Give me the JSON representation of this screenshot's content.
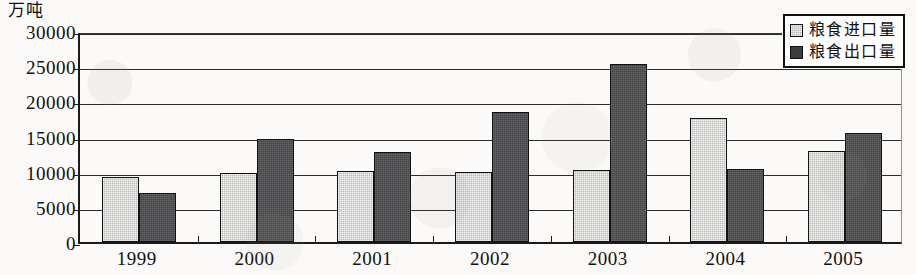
{
  "chart_data": {
    "type": "bar",
    "title": "",
    "unit_label": "万吨",
    "xlabel": "",
    "ylabel": "",
    "categories": [
      "1999",
      "2000",
      "2001",
      "2002",
      "2003",
      "2004",
      "2005"
    ],
    "series": [
      {
        "name": "粮食进口量",
        "color": "#b9b9b7",
        "values": [
          9200,
          9800,
          10100,
          10000,
          10200,
          17600,
          12900
        ]
      },
      {
        "name": "粮食出口量",
        "color": "#444446",
        "values": [
          6900,
          14600,
          12800,
          18500,
          25300,
          10400,
          15500
        ]
      }
    ],
    "ylim": [
      0,
      30000
    ],
    "yticks": [
      0,
      5000,
      10000,
      15000,
      20000,
      25000,
      30000
    ],
    "ytick_labels": [
      "0",
      "5000",
      "10000",
      "15000",
      "20000",
      "25000",
      "30000"
    ],
    "grid": true,
    "legend_position": "top-right"
  },
  "legend": {
    "items": [
      {
        "label": "粮食进口量",
        "swatch": "import"
      },
      {
        "label": "粮食出口量",
        "swatch": "export"
      }
    ]
  }
}
